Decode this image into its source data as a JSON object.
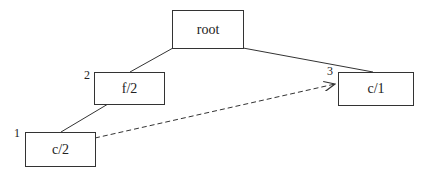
{
  "diagram": {
    "type": "tree",
    "nodes": [
      {
        "id": "root",
        "label": "root",
        "x": 172,
        "y": 10,
        "w": 72,
        "h": 39
      },
      {
        "id": "f2",
        "label": "f/2",
        "x": 94,
        "y": 72,
        "w": 71,
        "h": 33,
        "order": "2",
        "order_x": 84,
        "order_y": 68
      },
      {
        "id": "c1",
        "label": "c/1",
        "x": 338,
        "y": 72,
        "w": 76,
        "h": 34,
        "order": "3",
        "order_x": 327,
        "order_y": 64
      },
      {
        "id": "c2",
        "label": "c/2",
        "x": 25,
        "y": 132,
        "w": 71,
        "h": 35,
        "order": "1",
        "order_x": 14,
        "order_y": 126
      }
    ],
    "edges": [
      {
        "from": "root",
        "to": "f2",
        "style": "solid"
      },
      {
        "from": "root",
        "to": "c1",
        "style": "solid"
      },
      {
        "from": "f2",
        "to": "c2",
        "style": "solid"
      },
      {
        "from": "c2",
        "to": "c1",
        "style": "dashed",
        "arrow": true
      }
    ],
    "colors": {
      "stroke": "#333333",
      "background": "#ffffff"
    }
  }
}
